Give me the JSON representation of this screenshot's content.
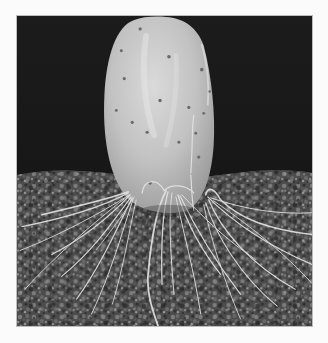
{
  "image": {
    "alt": "Grayscale photograph of a prickly pear cactus pad standing upright in gravelly soil, with pale fibrous roots spreading outward across the soil surface against a dark background",
    "subject": "cactus pad with roots",
    "colors": {
      "page_background": "#fbfbfb",
      "frame_border": "#bdbdbd",
      "backdrop": "#1a1a1a",
      "pad_light": "#d4d4d4",
      "pad_mid": "#b4b4b4",
      "soil_dark": "#3a3a3a",
      "soil_light": "#8a8a8a",
      "roots": "#e0e0e0"
    }
  }
}
